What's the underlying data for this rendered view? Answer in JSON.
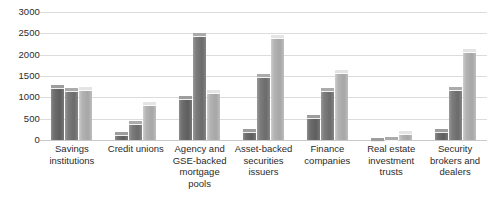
{
  "chart_data": {
    "type": "bar",
    "title": "",
    "subtitle": "",
    "xlabel": "",
    "ylabel": "",
    "ylim": [
      0,
      3000
    ],
    "yticks": [
      0,
      500,
      1000,
      1500,
      2000,
      2500,
      3000
    ],
    "ytick_labels": [
      "0",
      "500",
      "1000",
      "1500",
      "2000",
      "2500",
      "3000"
    ],
    "grid": "horizontal",
    "legend": "none",
    "orientation": "vertical",
    "categories": [
      "Savings\ninstitutions",
      "Credit unions",
      "Agency and\nGSE-backed\nmortgage\npools",
      "Asset-backed\nsecurities\nissuers",
      "Finance\ncompanies",
      "Real estate\ninvestment\ntrusts",
      "Security\nbrokers and\ndealers"
    ],
    "series": [
      {
        "name": "series-1",
        "color": "#6f6f6f",
        "values": [
          1300,
          180,
          1020,
          260,
          590,
          30,
          250
        ]
      },
      {
        "name": "series-2",
        "color": "#7d7d7d",
        "values": [
          1220,
          440,
          2500,
          1540,
          1230,
          60,
          1240
        ]
      },
      {
        "name": "series-3",
        "color": "#b4b4b4",
        "values": [
          1240,
          900,
          1170,
          2450,
          1630,
          210,
          2130
        ]
      }
    ]
  },
  "colors": {
    "background": "#ffffff",
    "gridline": "#dcdcdc",
    "axis_text": "#2b2b2b"
  }
}
